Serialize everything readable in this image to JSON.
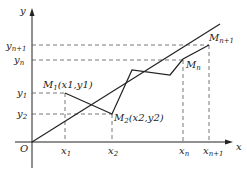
{
  "diagram": {
    "type": "iteration-path-diagram",
    "axes": {
      "x_label": "x",
      "y_label": "y",
      "origin_label": "O"
    },
    "x_ticks": [
      {
        "base": "x",
        "sub": "1"
      },
      {
        "base": "x",
        "sub": "2"
      },
      {
        "base": "x",
        "sub": "n"
      },
      {
        "base": "x",
        "sub": "n+1"
      }
    ],
    "y_ticks": [
      {
        "base": "y",
        "sub": "n+1"
      },
      {
        "base": "y",
        "sub": "n"
      },
      {
        "base": "y",
        "sub": "1"
      },
      {
        "base": "y",
        "sub": "2"
      }
    ],
    "points": [
      {
        "name": "M1",
        "label_base": "M",
        "label_sub": "1",
        "coords_text": "(x1,y1)"
      },
      {
        "name": "M2",
        "label_base": "M",
        "label_sub": "2",
        "coords_text": "(x2,y2)"
      },
      {
        "name": "Mn",
        "label_base": "M",
        "label_sub": "n"
      },
      {
        "name": "Mn+1",
        "label_base": "M",
        "label_sub": "n+1"
      }
    ],
    "colors": {
      "line": "#222222",
      "dashed": "#555555",
      "background": "#ffffff"
    }
  }
}
